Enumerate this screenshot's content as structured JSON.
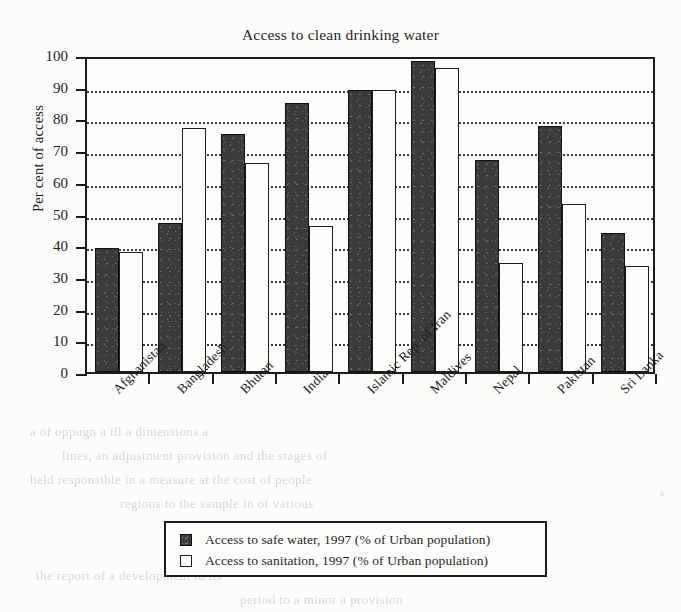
{
  "chart_data": {
    "type": "bar",
    "title": "Access to clean drinking water",
    "xlabel": "",
    "ylabel": "Per cent of access",
    "ylim": [
      0,
      100
    ],
    "ytick_step": 10,
    "yticks": [
      0,
      10,
      20,
      30,
      40,
      50,
      60,
      70,
      80,
      90,
      100
    ],
    "grid": true,
    "grid_style": "dotted horizontal",
    "legend_position": "below plot, centered, boxed",
    "categories": [
      "Afghanistan",
      "Bangladesh",
      "Bhutan",
      "India",
      "Islamic Rep. of Iran",
      "Maldives",
      "Nepal",
      "Pakistan",
      "Sri Lanka"
    ],
    "series": [
      {
        "name": "Access to safe water, 1997 (% of Urban population)",
        "color": "#3a3a3a",
        "style": "filled-dark",
        "values": [
          39,
          47,
          75,
          85,
          89,
          98,
          67,
          77.5,
          44
        ]
      },
      {
        "name": "Access to sanitation, 1997 (% of Urban population)",
        "color": "#ffffff",
        "style": "outlined-white",
        "values": [
          38,
          77,
          66,
          46,
          89,
          96,
          34.5,
          53,
          33.5
        ]
      }
    ]
  },
  "legend": {
    "items": [
      {
        "icon": "dark-swatch",
        "label": "Access to safe water, 1997 (% of Urban population)"
      },
      {
        "icon": "light-swatch",
        "label": "Access to sanitation, 1997 (% of Urban population)"
      }
    ]
  },
  "background_bleed": [
    {
      "text": "a of oppugn a ill a dimensions a",
      "x": 30,
      "y": 424,
      "size": 13
    },
    {
      "text": "lines, an adjustment provision and the stages of",
      "x": 62,
      "y": 448,
      "size": 13
    },
    {
      "text": "held responsible in a measure at the cost of people",
      "x": 30,
      "y": 472,
      "size": 13
    },
    {
      "text": "regions to the sample in of various",
      "x": 120,
      "y": 496,
      "size": 13
    },
    {
      "text": "the report of a development in its",
      "x": 36,
      "y": 568,
      "size": 13
    },
    {
      "text": "period to a minor a provision",
      "x": 240,
      "y": 592,
      "size": 13
    },
    {
      "text": "s",
      "x": 660,
      "y": 486,
      "size": 11
    }
  ]
}
